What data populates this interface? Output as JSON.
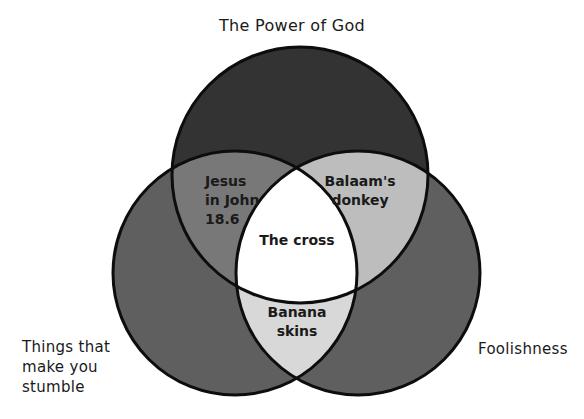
{
  "diagram": {
    "type": "venn-3",
    "sets": [
      {
        "id": "top",
        "label": "The Power of God",
        "fill": "#333333"
      },
      {
        "id": "left",
        "label": "Things that\nmake you\nstumble",
        "fill": "#5f5f5f"
      },
      {
        "id": "right",
        "label": "Foolishness",
        "fill": "#5f5f5f"
      }
    ],
    "intersections": {
      "top_left": {
        "text": "Jesus\nin John\n18.6",
        "fill": "#787878"
      },
      "top_right": {
        "text": "Balaam's\ndonkey",
        "fill": "#bdbdbd"
      },
      "left_right": {
        "text": "Banana\nskins",
        "fill": "#d8d8d8"
      },
      "all": {
        "text": "The cross",
        "fill": "#ffffff"
      }
    },
    "outline_color": "#0d0d0d"
  }
}
